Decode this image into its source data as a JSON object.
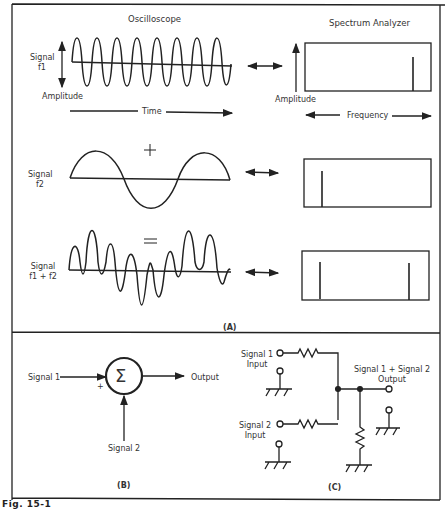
{
  "panel_a": {
    "label": "(A)",
    "oscilloscope_title": "Oscilloscope",
    "spectrum_title": "Spectrum Analyzer",
    "row1": {
      "signal_label_1": "Signal",
      "signal_label_2": "f1",
      "amplitude": "Amplitude",
      "time": "Time",
      "spec_amplitude": "Amplitude",
      "frequency": "Frequency"
    },
    "plus": "+",
    "row2": {
      "signal_label_1": "Signal",
      "signal_label_2": "f2"
    },
    "equals": "=",
    "row3": {
      "signal_label_1": "Signal",
      "signal_label_2": "f1 + f2"
    }
  },
  "panel_b": {
    "label": "(B)",
    "input1": "Signal 1",
    "input2": "Signal 2",
    "plus_sign": "+",
    "sigma": "Σ",
    "output": "Output"
  },
  "panel_c": {
    "label": "(C)",
    "input1_line1": "Signal 1",
    "input1_line2": "Input",
    "input2_line1": "Signal 2",
    "input2_line2": "Input",
    "output_line1": "Signal 1 + Signal 2",
    "output_line2": "Output"
  },
  "caption": "Fig. 15-1"
}
